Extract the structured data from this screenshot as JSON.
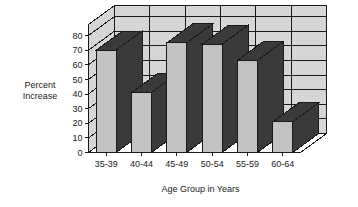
{
  "chart_data": {
    "type": "bar",
    "title": "",
    "subtitle": "",
    "categories": [
      "35-39",
      "40-44",
      "45-49",
      "50-54",
      "55-59",
      "60-64"
    ],
    "values": [
      70,
      41,
      75,
      74,
      63,
      21
    ],
    "xlabel": "Age Group in Years",
    "ylabel": "Percent Increase",
    "ylabel_line1": "Percent",
    "ylabel_line2": "Increase",
    "ylim": [
      0,
      80
    ],
    "ytick_step": 10,
    "yticks": [
      "0",
      "10",
      "20",
      "30",
      "40",
      "50",
      "60",
      "70",
      "80"
    ],
    "grid": true,
    "grid_axis": "y",
    "legend": false,
    "legend_position": "none",
    "style": "3d-perspective",
    "colors": {
      "bar_front": "#c2c2c2",
      "bar_side": "#3a3a3a",
      "bar_top": "#3a3a3a",
      "wall": "#d6d6d6",
      "floor": "#ffffff",
      "gridline": "#1a1a1a",
      "axis": "#1a1a1a",
      "text": "#1a1a1a",
      "background": "#ffffff"
    }
  }
}
